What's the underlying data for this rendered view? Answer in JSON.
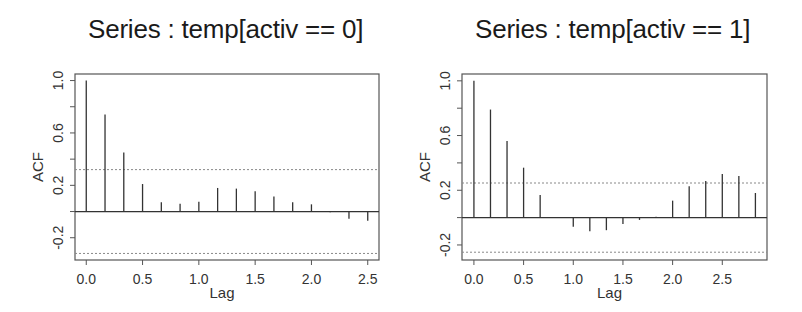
{
  "chart_data": [
    {
      "type": "bar",
      "subtype": "acf-stem",
      "title": "Series : temp[activ == 0]",
      "xlabel": "Lag",
      "ylabel": "ACF",
      "xlim": [
        -0.1,
        2.6
      ],
      "ylim": [
        -0.37,
        1.05
      ],
      "xticks": [
        0.0,
        0.5,
        1.0,
        1.5,
        2.0,
        2.5
      ],
      "xtick_labels": [
        "0.0",
        "0.5",
        "1.0",
        "1.5",
        "2.0",
        "2.5"
      ],
      "yticks": [
        -0.2,
        0.0,
        0.2,
        0.4,
        0.6,
        0.8,
        1.0
      ],
      "ytick_labels": [
        "-0.2",
        "",
        "0.2",
        "",
        "0.6",
        "",
        "1.0"
      ],
      "confidence_bound": 0.32,
      "grid": false,
      "x": [
        0.0,
        0.1667,
        0.3333,
        0.5,
        0.6667,
        0.8333,
        1.0,
        1.1667,
        1.3333,
        1.5,
        1.6667,
        1.8333,
        2.0,
        2.1667,
        2.3333,
        2.5
      ],
      "values": [
        1.0,
        0.74,
        0.45,
        0.21,
        0.07,
        0.06,
        0.075,
        0.18,
        0.175,
        0.155,
        0.115,
        0.07,
        0.055,
        -0.005,
        -0.055,
        -0.07
      ]
    },
    {
      "type": "bar",
      "subtype": "acf-stem",
      "title": "Series : temp[activ == 1]",
      "xlabel": "Lag",
      "ylabel": "ACF",
      "xlim": [
        -0.12,
        2.95
      ],
      "ylim": [
        -0.31,
        1.05
      ],
      "xticks": [
        0.0,
        0.5,
        1.0,
        1.5,
        2.0,
        2.5
      ],
      "xtick_labels": [
        "0.0",
        "0.5",
        "1.0",
        "1.5",
        "2.0",
        "2.5"
      ],
      "yticks": [
        -0.2,
        0.0,
        0.2,
        0.4,
        0.6,
        0.8,
        1.0
      ],
      "ytick_labels": [
        "-0.2",
        "",
        "0.2",
        "",
        "0.6",
        "",
        "1.0"
      ],
      "confidence_bound": 0.253,
      "grid": false,
      "x": [
        0.0,
        0.1667,
        0.3333,
        0.5,
        0.6667,
        0.8333,
        1.0,
        1.1667,
        1.3333,
        1.5,
        1.6667,
        1.8333,
        2.0,
        2.1667,
        2.3333,
        2.5,
        2.6667,
        2.8333
      ],
      "values": [
        1.0,
        0.79,
        0.56,
        0.365,
        0.165,
        0.005,
        -0.066,
        -0.1,
        -0.092,
        -0.046,
        -0.017,
        0.007,
        0.124,
        0.229,
        0.268,
        0.319,
        0.304,
        0.18
      ]
    }
  ]
}
